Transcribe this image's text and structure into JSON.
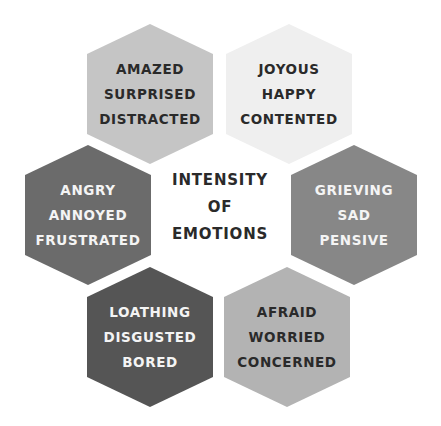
{
  "title": {
    "lines": [
      "INTENSITY",
      "OF",
      "EMOTIONS"
    ]
  },
  "hexagons": [
    {
      "position": "top-left",
      "color": "#c5c5c5",
      "text_color": "#2a2a2a",
      "lines": [
        "AMAZED",
        "SURPRISED",
        "DISTRACTED"
      ]
    },
    {
      "position": "top-right",
      "color": "#efefef",
      "text_color": "#2a2a2a",
      "lines": [
        "JOYOUS",
        "HAPPY",
        "CONTENTED"
      ]
    },
    {
      "position": "middle-left",
      "color": "#6b6b6b",
      "text_color": "#f4f4f4",
      "lines": [
        "ANGRY",
        "ANNOYED",
        "FRUSTRATED"
      ]
    },
    {
      "position": "middle-right",
      "color": "#878787",
      "text_color": "#f4f4f4",
      "lines": [
        "GRIEVING",
        "SAD",
        "PENSIVE"
      ]
    },
    {
      "position": "bottom-left",
      "color": "#555555",
      "text_color": "#f4f4f4",
      "lines": [
        "LOATHING",
        "DISGUSTED",
        "BORED"
      ]
    },
    {
      "position": "bottom-right",
      "color": "#b3b3b3",
      "text_color": "#2a2a2a",
      "lines": [
        "AFRAID",
        "WORRIED",
        "CONCERNED"
      ]
    }
  ]
}
